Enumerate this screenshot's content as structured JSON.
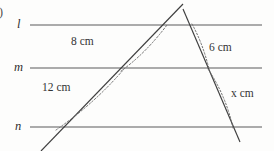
{
  "figure": {
    "item_marker": ")",
    "parallel_lines": [
      {
        "name": "l",
        "y": 25
      },
      {
        "name": "m",
        "y": 68
      },
      {
        "name": "n",
        "y": 127
      }
    ],
    "measures": [
      {
        "id": "left-upper",
        "text": "8 cm",
        "value": 8,
        "unit": "cm"
      },
      {
        "id": "left-lower",
        "text": "12 cm",
        "value": 12,
        "unit": "cm"
      },
      {
        "id": "right-upper",
        "text": "6 cm",
        "value": 6,
        "unit": "cm"
      },
      {
        "id": "right-lower",
        "text": "x cm",
        "value": "x",
        "unit": "cm"
      }
    ],
    "colors": {
      "line": "#5a5a5a",
      "transversal": "#3f3f3f",
      "dotted": "#6e6e6e",
      "text": "#343434",
      "background": "#fdfdfc"
    }
  }
}
